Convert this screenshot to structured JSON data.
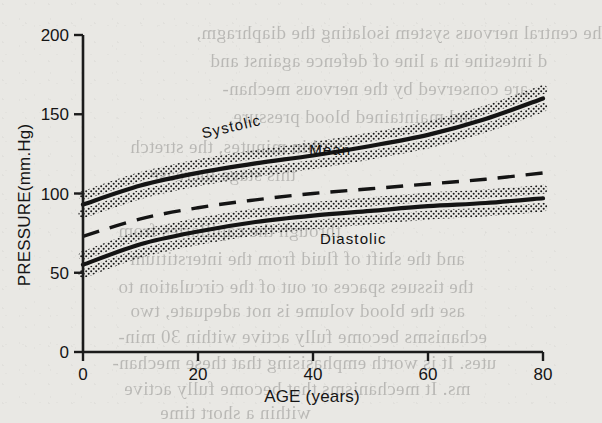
{
  "figure": {
    "name": "blood-pressure-vs-age",
    "background_color": "#e9e8e4",
    "ink_color": "#141414"
  },
  "chart_data": {
    "type": "line",
    "title": "",
    "xlabel": "AGE (years)",
    "ylabel": "PRESSURE(mm.Hg)",
    "xlim": [
      0,
      80
    ],
    "ylim": [
      0,
      200
    ],
    "xticks": [
      0,
      20,
      40,
      60,
      80
    ],
    "yticks": [
      0,
      50,
      100,
      150,
      200
    ],
    "xtick_labels": [
      "0",
      "20",
      "40",
      "60",
      "80"
    ],
    "ytick_labels": [
      "0",
      "50",
      "100",
      "150",
      "200"
    ],
    "grid": false,
    "legend": "inline-annotations",
    "x": [
      0,
      10,
      20,
      30,
      40,
      50,
      60,
      70,
      80
    ],
    "series": [
      {
        "name": "Systolic",
        "style": "solid",
        "band": "stippled",
        "band_halfwidth": 9,
        "values": [
          93,
          105,
          113,
          119,
          124,
          130,
          137,
          147,
          160
        ],
        "label": "Systolic",
        "label_x": 26,
        "label_y": 139,
        "label_rotation": -13
      },
      {
        "name": "Mean",
        "style": "dashed",
        "band": "none",
        "values": [
          73,
          84,
          91,
          96,
          100,
          103,
          106,
          109,
          113
        ],
        "label": "Mean",
        "label_x": 43,
        "label_y": 124,
        "label_rotation": 0
      },
      {
        "name": "Diastolic",
        "style": "solid",
        "band": "stippled",
        "band_halfwidth": 9,
        "values": [
          55,
          68,
          76,
          82,
          86,
          89,
          92,
          94,
          97
        ],
        "label": "Diastolic",
        "label_x": 47,
        "label_y": 68,
        "label_rotation": 0
      }
    ]
  },
  "scan_artifacts": {
    "description": "faint mirrored bleed-through text from reverse page",
    "lines": [
      {
        "text": "he central nervous system isolating the diaphragm,",
        "x": 196,
        "y": 22,
        "size": 19
      },
      {
        "text": "d intestine in a line of defence against and",
        "x": 210,
        "y": 50,
        "size": 19
      },
      {
        "text": "are conserved by the nervous mechan-",
        "x": 222,
        "y": 78,
        "size": 19
      },
      {
        "text": "and maintained blood pressure.",
        "x": 228,
        "y": 106,
        "size": 19
      },
      {
        "text": "within minutes, the stretch",
        "x": 130,
        "y": 136,
        "size": 19
      },
      {
        "text": "this stage increase",
        "x": 150,
        "y": 164,
        "size": 19
      },
      {
        "text": "through the capillaries from",
        "x": 118,
        "y": 220,
        "size": 19
      },
      {
        "text": "and the shift of fluid from the interstitium",
        "x": 130,
        "y": 248,
        "size": 19
      },
      {
        "text": "the tissues spaces or out of the circulation to",
        "x": 118,
        "y": 276,
        "size": 19
      },
      {
        "text": "ase the blood volume is not adequate, two",
        "x": 130,
        "y": 300,
        "size": 19
      },
      {
        "text": "echanisms become fully active within 30 min-",
        "x": 118,
        "y": 326,
        "size": 19
      },
      {
        "text": "utes. It is worth emphasising that these mechan-",
        "x": 112,
        "y": 352,
        "size": 19
      },
      {
        "text": "ms. It mechanisms that become fully active",
        "x": 124,
        "y": 378,
        "size": 19
      },
      {
        "text": "within a short time",
        "x": 160,
        "y": 402,
        "size": 19
      }
    ]
  }
}
